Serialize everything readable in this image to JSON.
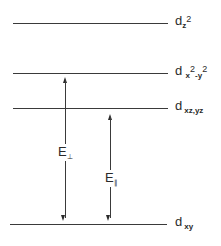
{
  "diagram": {
    "title": "",
    "type": "energy-level-diagram",
    "levels": [
      {
        "id": "dz2",
        "label_main": "d",
        "label_sub": "z",
        "label_sup": "2",
        "label_text": "dz2",
        "y": 23
      },
      {
        "id": "dx2-y2",
        "label_main": "d",
        "label_sub1": "x",
        "label_sup1": "2",
        "label_sub2": "-y",
        "label_sup2": "2",
        "label_text": "dx2-y2",
        "y": 73
      },
      {
        "id": "dxz-yz",
        "label_main": "d",
        "label_sub": "xz,yz",
        "label_text": "dxz,yz",
        "y": 108
      },
      {
        "id": "dxy",
        "label_main": "d",
        "label_sub": "xy",
        "label_text": "dxy",
        "y": 224
      }
    ],
    "transitions": [
      {
        "id": "E-perp",
        "label_main": "E",
        "label_sub": "⊥",
        "from": "dxy",
        "to": "dx2-y2"
      },
      {
        "id": "E-parallel",
        "label_main": "E",
        "label_sub": "∥",
        "from": "dxy",
        "to": "dxz-yz"
      }
    ]
  }
}
